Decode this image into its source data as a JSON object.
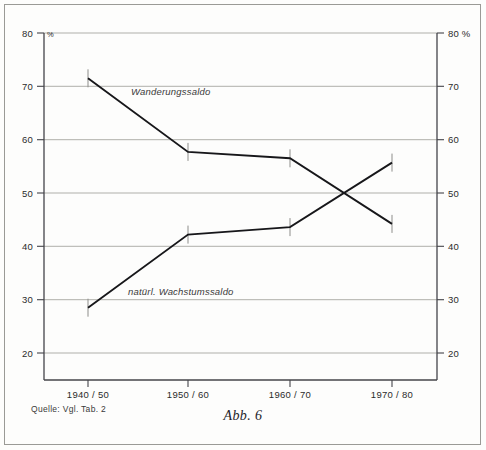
{
  "figure": {
    "caption": "Abb. 6",
    "source_note": "Quelle: Vgl. Tab. 2"
  },
  "axes": {
    "unit_symbol_left": "%",
    "unit_suffix_right": "80 %",
    "y_ticks_left": [
      "80",
      "70",
      "60",
      "50",
      "40",
      "30",
      "20"
    ],
    "y_ticks_right": [
      "80 %",
      "70",
      "60",
      "50",
      "40",
      "30",
      "20"
    ],
    "x_ticks": [
      "1940 / 50",
      "1950 / 60",
      "1960 / 70",
      "1970 / 80"
    ]
  },
  "colors": {
    "line": "#17171a",
    "grid": "#9d9d99",
    "axis": "#44444a",
    "tick_marker": "#8d8d8a",
    "page_background": "#fdfdfc"
  },
  "chart_data": {
    "type": "line",
    "title": "Abb. 6",
    "xlabel": "",
    "ylabel": "%",
    "ylim": [
      20,
      80
    ],
    "grid": true,
    "legend_position": "inline-annotations",
    "categories": [
      "1940 / 50",
      "1950 / 60",
      "1960 / 70",
      "1970 / 80"
    ],
    "series": [
      {
        "name": "Wanderungssaldo",
        "values": [
          71.5,
          57.7,
          56.5,
          44.2
        ],
        "label_x": "1950 / 60",
        "annotation": "Wanderungssaldo"
      },
      {
        "name": "natürl. Wachstumssaldo",
        "values": [
          28.5,
          42.2,
          43.6,
          55.7
        ],
        "label_x": "1950 / 60",
        "annotation": "natürl. Wachstumssaldo"
      }
    ],
    "annotations": [
      {
        "text": "Wanderungssaldo",
        "x_px": 131,
        "y_px": 95
      },
      {
        "text": "natürl. Wachstumssaldo",
        "x_px": 128,
        "y_px": 295
      }
    ],
    "yticks": [
      20,
      30,
      40,
      50,
      60,
      70,
      80
    ]
  }
}
